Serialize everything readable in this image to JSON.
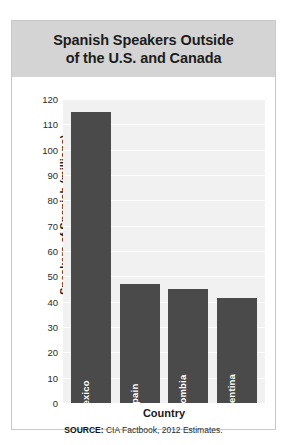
{
  "figure": {
    "title_line_1": "Spanish Speakers Outside",
    "title_line_2": "of the U.S. and Canada",
    "source_label": "SOURCE:",
    "source_text": " CIA Factbook, 2012 Estimates."
  },
  "colors": {
    "title_band": "#d4d4d4",
    "plot_background": "#f1f1f1",
    "bar_fill": "#4a4a4a",
    "gridline": "#ffffff",
    "frame_border": "#c8c8c8",
    "text": "#1a1a1a"
  },
  "chart_data": {
    "type": "bar",
    "title": "Spanish Speakers Outside of the U.S. and Canada",
    "xlabel": "Country",
    "ylabel": "Speakers of Spanish (millions)",
    "categories": [
      "Mexico",
      "Spain",
      "Colombia",
      "Argentina"
    ],
    "values": [
      115,
      47,
      45,
      41.5
    ],
    "ylim": [
      0,
      120
    ],
    "ytick_step": 10,
    "yticks": [
      120,
      110,
      100,
      90,
      80,
      70,
      60,
      50,
      40,
      30,
      20,
      10,
      0
    ],
    "grid": true,
    "grid_axis": "y",
    "legend": false,
    "orientation": "vertical",
    "bar_label_position": "inside-bottom-rotated"
  }
}
